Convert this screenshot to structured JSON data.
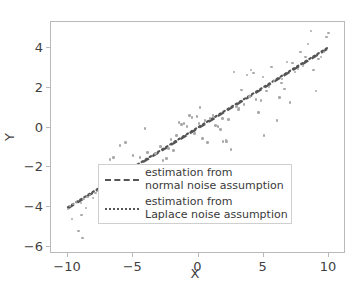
{
  "chart_data": {
    "type": "scatter",
    "title": "",
    "xlabel": "X",
    "ylabel": "Y",
    "xlim": [
      -11.3,
      11.3
    ],
    "ylim": [
      -6.35,
      5.3
    ],
    "xticks": [
      -10,
      -5,
      0,
      5,
      10
    ],
    "yticks": [
      -6,
      -4,
      -2,
      0,
      2,
      4
    ],
    "xtick_labels": [
      "−10",
      "−5",
      "0",
      "5",
      "10"
    ],
    "ytick_labels": [
      "−6",
      "−4",
      "−2",
      "0",
      "2",
      "4"
    ],
    "grid": false,
    "legend_position": "lower right",
    "point_color": "#a8a8a8",
    "line_color": "#555555",
    "series": [
      {
        "name": "scatter-observations",
        "type": "scatter",
        "points": [
          [
            -10.0,
            -4.1
          ],
          [
            -9.85,
            -3.95
          ],
          [
            -9.7,
            -4.6
          ],
          [
            -9.6,
            -3.85
          ],
          [
            -9.4,
            -3.75
          ],
          [
            -9.2,
            -5.2
          ],
          [
            -9.0,
            -3.8
          ],
          [
            -8.9,
            -5.55
          ],
          [
            -8.8,
            -3.6
          ],
          [
            -8.6,
            -4.05
          ],
          [
            -8.5,
            -3.5
          ],
          [
            -8.3,
            -3.4
          ],
          [
            -8.1,
            -3.55
          ],
          [
            -7.9,
            -3.3
          ],
          [
            -7.7,
            -3.2
          ],
          [
            -7.5,
            -3.15
          ],
          [
            -7.3,
            -2.9
          ],
          [
            -7.1,
            -4.05
          ],
          [
            -7.0,
            -2.25
          ],
          [
            -6.9,
            -2.6
          ],
          [
            -6.8,
            -1.6
          ],
          [
            -6.6,
            -2.15
          ],
          [
            -6.5,
            -1.5
          ],
          [
            -6.4,
            -3.1
          ],
          [
            -6.2,
            -2.5
          ],
          [
            -6.0,
            -0.9
          ],
          [
            -5.9,
            -2.05
          ],
          [
            -5.8,
            -3.45
          ],
          [
            -5.7,
            -3.85
          ],
          [
            -5.6,
            -0.75
          ],
          [
            -5.4,
            -2.0
          ],
          [
            -5.3,
            -3.3
          ],
          [
            -5.1,
            -2.7
          ],
          [
            -5.0,
            -1.4
          ],
          [
            -4.9,
            -2.85
          ],
          [
            -4.7,
            -1.95
          ],
          [
            -4.5,
            -1.5
          ],
          [
            -4.3,
            -3.2
          ],
          [
            -4.1,
            -0.05
          ],
          [
            -3.9,
            -1.25
          ],
          [
            -3.7,
            -1.9
          ],
          [
            -3.5,
            -2.25
          ],
          [
            -3.3,
            -1.3
          ],
          [
            -3.1,
            -2.5
          ],
          [
            -2.9,
            -0.95
          ],
          [
            -2.7,
            -1.65
          ],
          [
            -2.5,
            -2.35
          ],
          [
            -2.3,
            -1.05
          ],
          [
            -2.1,
            -0.6
          ],
          [
            -1.9,
            -1.15
          ],
          [
            -1.7,
            -0.4
          ],
          [
            -1.5,
            0.25
          ],
          [
            -1.3,
            0.15
          ],
          [
            -1.1,
            0.2
          ],
          [
            -0.9,
            0.05
          ],
          [
            -0.7,
            0.6
          ],
          [
            -0.5,
            0.5
          ],
          [
            -0.3,
            -0.3
          ],
          [
            -0.1,
            0.55
          ],
          [
            0.1,
            1.0
          ],
          [
            0.3,
            -0.55
          ],
          [
            0.5,
            0.35
          ],
          [
            0.7,
            -0.75
          ],
          [
            0.9,
            0.45
          ],
          [
            1.1,
            0.6
          ],
          [
            1.3,
            0.1
          ],
          [
            1.5,
            0.05
          ],
          [
            1.7,
            -0.1
          ],
          [
            1.9,
            -0.7
          ],
          [
            2.1,
            -0.65
          ],
          [
            2.3,
            0.4
          ],
          [
            2.5,
            -1.1
          ],
          [
            2.7,
            2.8
          ],
          [
            2.9,
            1.05
          ],
          [
            3.1,
            0.95
          ],
          [
            3.3,
            1.9
          ],
          [
            3.5,
            1.15
          ],
          [
            3.7,
            2.65
          ],
          [
            3.9,
            1.55
          ],
          [
            4.0,
            2.9
          ],
          [
            4.2,
            2.75
          ],
          [
            4.4,
            1.4
          ],
          [
            4.6,
            0.75
          ],
          [
            4.8,
            1.35
          ],
          [
            5.0,
            -0.4
          ],
          [
            5.2,
            1.85
          ],
          [
            5.4,
            2.05
          ],
          [
            5.6,
            3.05
          ],
          [
            5.8,
            2.35
          ],
          [
            6.0,
            0.35
          ],
          [
            6.2,
            1.5
          ],
          [
            6.4,
            2.45
          ],
          [
            6.6,
            1.95
          ],
          [
            6.8,
            3.3
          ],
          [
            7.0,
            1.25
          ],
          [
            7.2,
            3.25
          ],
          [
            7.4,
            2.8
          ],
          [
            7.6,
            2.95
          ],
          [
            7.8,
            3.8
          ],
          [
            8.0,
            3.1
          ],
          [
            8.2,
            3.55
          ],
          [
            8.4,
            4.2
          ],
          [
            8.6,
            4.85
          ],
          [
            8.8,
            2.9
          ],
          [
            9.0,
            1.85
          ],
          [
            9.2,
            3.45
          ],
          [
            9.4,
            3.55
          ],
          [
            9.6,
            3.8
          ],
          [
            9.8,
            4.55
          ],
          [
            9.95,
            4.75
          ],
          [
            -4.4,
            -3.15
          ],
          [
            -2.45,
            -1.55
          ],
          [
            1.85,
            0.45
          ],
          [
            3.05,
            0.9
          ],
          [
            6.35,
            2.25
          ],
          [
            0.05,
            0.2
          ],
          [
            -7.35,
            -3.25
          ],
          [
            -8.95,
            -4.4
          ],
          [
            2.15,
            -0.7
          ],
          [
            4.95,
            2.55
          ]
        ]
      },
      {
        "name": "estimation from normal noise assumption",
        "type": "line",
        "style": "dashed",
        "endpoints": [
          [
            -10.0,
            -4.05
          ],
          [
            10.0,
            4.0
          ]
        ]
      },
      {
        "name": "estimation from Laplace noise assumption",
        "type": "line",
        "style": "dotted",
        "endpoints": [
          [
            -10.0,
            -4.0
          ],
          [
            10.0,
            4.05
          ]
        ]
      }
    ]
  },
  "legend": {
    "entries": [
      {
        "label": "estimation from\nnormal noise assumption",
        "style": "dashed"
      },
      {
        "label": "estimation from\nLaplace noise assumption",
        "style": "dotted"
      }
    ]
  },
  "axes": {
    "xlabel": "X",
    "ylabel": "Y"
  }
}
